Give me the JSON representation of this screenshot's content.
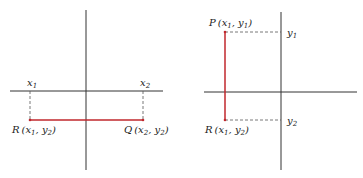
{
  "colors": {
    "axis": "#333333",
    "segment": "#c0272d",
    "dashed": "#555555",
    "text": "#222222"
  },
  "left_diagram": {
    "x_tick_labels": [
      {
        "base": "x",
        "sub": "1"
      },
      {
        "base": "x",
        "sub": "2"
      }
    ],
    "points": {
      "R": {
        "name": "R",
        "open": "(",
        "x": "x",
        "xsub": "1",
        "sep": ", ",
        "y": "y",
        "ysub": "2",
        "close": ")"
      },
      "Q": {
        "name": "Q",
        "open": "(",
        "x": "x",
        "xsub": "2",
        "sep": ", ",
        "y": "y",
        "ysub": "2",
        "close": ")"
      }
    },
    "segment": "RQ (horizontal)"
  },
  "right_diagram": {
    "y_tick_labels": [
      {
        "base": "y",
        "sub": "1"
      },
      {
        "base": "y",
        "sub": "2"
      }
    ],
    "points": {
      "P": {
        "name": "P",
        "open": "(",
        "x": "x",
        "xsub": "1",
        "sep": ", ",
        "y": "y",
        "ysub": "1",
        "close": ")"
      },
      "R": {
        "name": "R",
        "open": "(",
        "x": "x",
        "xsub": "1",
        "sep": ", ",
        "y": "y",
        "ysub": "2",
        "close": ")"
      }
    },
    "segment": "PR (vertical)"
  }
}
